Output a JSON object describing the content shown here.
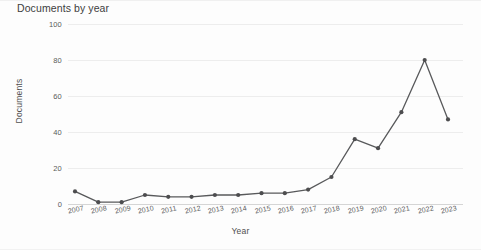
{
  "chart_data": {
    "type": "line",
    "title": "Documents by year",
    "xlabel": "Year",
    "ylabel": "Documents",
    "categories": [
      "2007",
      "2008",
      "2009",
      "2010",
      "2011",
      "2012",
      "2013",
      "2014",
      "2015",
      "2016",
      "2017",
      "2018",
      "2019",
      "2020",
      "2021",
      "2022",
      "2023"
    ],
    "values": [
      7,
      1,
      1,
      5,
      4,
      4,
      5,
      5,
      6,
      6,
      8,
      15,
      36,
      31,
      51,
      80,
      47
    ],
    "ylim": [
      0,
      100
    ],
    "yticks": [
      0,
      20,
      40,
      60,
      80,
      100
    ],
    "ytick_labels": [
      "0",
      "20",
      "40",
      "60",
      "80",
      "100"
    ],
    "grid": true,
    "legend": "none",
    "series_color": "#58595b",
    "marker": "circle",
    "marker_color": "#4d4d4f",
    "grid_color": "#ededed",
    "background": "#fdfdfd"
  }
}
